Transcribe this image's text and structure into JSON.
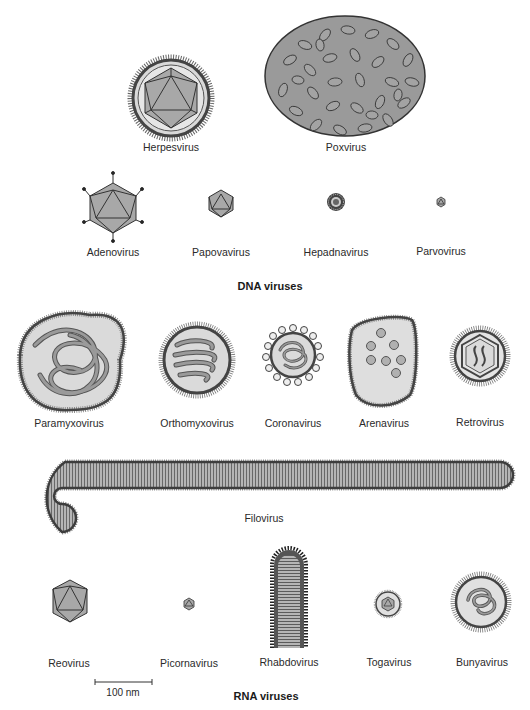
{
  "dna": {
    "title": "DNA viruses",
    "viruses": [
      {
        "name": "Herpesvirus"
      },
      {
        "name": "Poxvirus"
      },
      {
        "name": "Adenovirus"
      },
      {
        "name": "Papovavirus"
      },
      {
        "name": "Hepadnavirus"
      },
      {
        "name": "Parvovirus"
      }
    ]
  },
  "rna": {
    "title": "RNA viruses",
    "viruses": [
      {
        "name": "Paramyxovirus"
      },
      {
        "name": "Orthomyxovirus"
      },
      {
        "name": "Coronavirus"
      },
      {
        "name": "Arenavirus"
      },
      {
        "name": "Retrovirus"
      },
      {
        "name": "Filovirus"
      },
      {
        "name": "Reovirus"
      },
      {
        "name": "Picornavirus"
      },
      {
        "name": "Rhabdovirus"
      },
      {
        "name": "Togavirus"
      },
      {
        "name": "Bunyavirus"
      }
    ]
  },
  "scale_bar": {
    "label": "100 nm"
  },
  "colors": {
    "fill_gray": "#a6a6a6",
    "fill_light": "#dcdcdc",
    "outline": "#333333",
    "envelope": "#4a4a4a"
  }
}
